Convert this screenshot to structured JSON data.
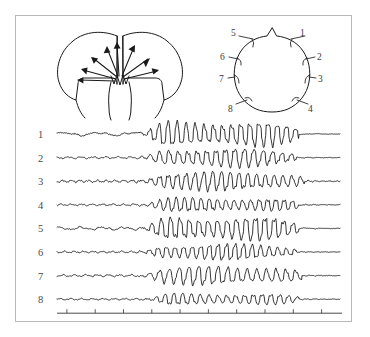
{
  "figure": {
    "background": "#ffffff",
    "frame_color": "#b9b9b9",
    "ink_color": "#1a1a1a"
  },
  "brain_panel": {
    "name": "coronal-brain-section",
    "description": "Coronal section of cerebral hemispheres with arrows radiating from a midline subcortical spike generator",
    "arrow_count": 8,
    "generator_glyph": "zigzag"
  },
  "head_panel": {
    "name": "electrode-placement-map",
    "description": "Top-down head outline with nose at top and eight scalp electrode positions",
    "electrodes": [
      {
        "id": "1",
        "label": "1",
        "side": "right",
        "region": "frontal"
      },
      {
        "id": "2",
        "label": "2",
        "side": "right",
        "region": "anterior-temporal"
      },
      {
        "id": "3",
        "label": "3",
        "side": "right",
        "region": "posterior-temporal"
      },
      {
        "id": "4",
        "label": "4",
        "side": "right",
        "region": "occipital"
      },
      {
        "id": "5",
        "label": "5",
        "side": "left",
        "region": "frontal"
      },
      {
        "id": "6",
        "label": "6",
        "side": "left",
        "region": "anterior-temporal"
      },
      {
        "id": "7",
        "label": "7",
        "side": "left",
        "region": "posterior-temporal"
      },
      {
        "id": "8",
        "label": "8",
        "side": "left",
        "region": "occipital"
      }
    ]
  },
  "chart_data": {
    "type": "line",
    "title": "",
    "subtitle": "",
    "xlabel": "",
    "ylabel": "",
    "grid": false,
    "legend_position": "none",
    "axis": {
      "x_start_px": 57,
      "x_end_px": 340,
      "tick_count": 10,
      "tick_labels": [],
      "baseline_only": true
    },
    "channel_labels": [
      "1",
      "2",
      "3",
      "4",
      "5",
      "6",
      "7",
      "8"
    ],
    "epochs": [
      {
        "name": "pre-ictal baseline",
        "x_fraction": [
          0.0,
          0.3
        ],
        "amplitude": "low"
      },
      {
        "name": "generalized spike-and-wave discharge",
        "x_fraction": [
          0.3,
          0.84
        ],
        "amplitude": "high"
      },
      {
        "name": "post-ictal attenuation",
        "x_fraction": [
          0.84,
          1.0
        ],
        "amplitude": "very low"
      }
    ],
    "series": [
      {
        "name": "1",
        "onset_fraction": 0.3,
        "offset_fraction": 0.855,
        "baseline_amp": 2.1,
        "burst_amp": 11.0,
        "baseline_freq": 1.5,
        "burst_freq": 3.1,
        "spikiness": 0.85,
        "post_amp": 0.7
      },
      {
        "name": "2",
        "onset_fraction": 0.305,
        "offset_fraction": 0.845,
        "baseline_amp": 1.2,
        "burst_amp": 8.2,
        "baseline_freq": 4.2,
        "burst_freq": 3.0,
        "spikiness": 0.8,
        "post_amp": 0.6
      },
      {
        "name": "3",
        "onset_fraction": 0.295,
        "offset_fraction": 0.875,
        "baseline_amp": 1.5,
        "burst_amp": 8.8,
        "baseline_freq": 6.0,
        "burst_freq": 3.2,
        "spikiness": 0.55,
        "post_amp": 1.3
      },
      {
        "name": "4",
        "onset_fraction": 0.3,
        "offset_fraction": 0.855,
        "baseline_amp": 1.1,
        "burst_amp": 6.4,
        "baseline_freq": 5.0,
        "burst_freq": 3.4,
        "spikiness": 0.6,
        "post_amp": 0.9
      },
      {
        "name": "5",
        "onset_fraction": 0.305,
        "offset_fraction": 0.855,
        "baseline_amp": 1.9,
        "burst_amp": 10.2,
        "baseline_freq": 2.4,
        "burst_freq": 3.0,
        "spikiness": 0.9,
        "post_amp": 0.8
      },
      {
        "name": "6",
        "onset_fraction": 0.3,
        "offset_fraction": 0.845,
        "baseline_amp": 1.1,
        "burst_amp": 7.0,
        "baseline_freq": 5.5,
        "burst_freq": 3.3,
        "spikiness": 0.85,
        "post_amp": 0.7
      },
      {
        "name": "7",
        "onset_fraction": 0.295,
        "offset_fraction": 0.865,
        "baseline_amp": 1.3,
        "burst_amp": 8.6,
        "baseline_freq": 4.6,
        "burst_freq": 2.9,
        "spikiness": 0.5,
        "post_amp": 0.8
      },
      {
        "name": "8",
        "onset_fraction": 0.315,
        "offset_fraction": 0.855,
        "baseline_amp": 1.0,
        "burst_amp": 5.2,
        "baseline_freq": 4.8,
        "burst_freq": 3.2,
        "spikiness": 0.55,
        "post_amp": 0.7
      }
    ]
  }
}
